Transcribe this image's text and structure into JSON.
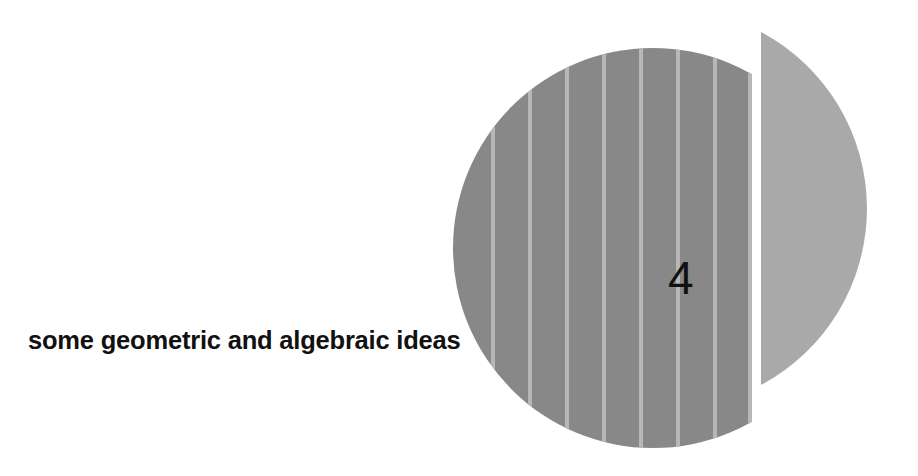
{
  "page": {
    "width": 918,
    "height": 476,
    "background": "#ffffff",
    "kind": "book-chapter-opener"
  },
  "chapter": {
    "number": "4",
    "title": "some geometric and algebraic ideas"
  },
  "artwork": {
    "description": "striped disc with detached circular segment",
    "colors": {
      "disc_fill": "#888888",
      "disc_stripe": "#b7b7b7",
      "segment_fill": "#a9a9a9",
      "background": "#ffffff"
    },
    "disc": {
      "center_x": 653,
      "center_y": 248,
      "radius": 200,
      "cut_x": 752,
      "stripe_spacing": 37,
      "stripe_width": 4,
      "stripe_positions": [
        493,
        530,
        567,
        604,
        641,
        678,
        715,
        752
      ]
    },
    "segment": {
      "flat_edge_x": 761,
      "apex_x": 862,
      "top_y": 32,
      "bottom_y": 385
    }
  }
}
